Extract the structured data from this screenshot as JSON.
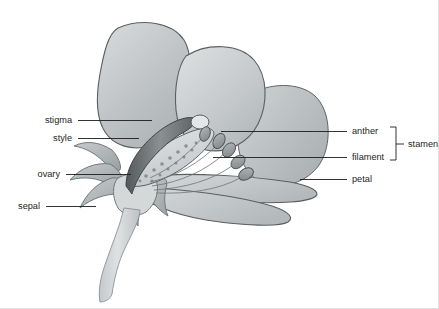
{
  "figure": {
    "background_color": "#ffffff",
    "line_color": "#1d1d1d",
    "petal_color": "#b9bdbf",
    "petal_highlight_color": "#d8dbdc",
    "sepal_color": "#a9aeb0",
    "stem_color": "#c9cdcf",
    "anther_color": "#9a9fa2",
    "ovary_color": "#cfd3d4",
    "style_color": "#70757a"
  },
  "labels": {
    "left": [
      {
        "id": "stigma",
        "text": "stigma",
        "text_x": 72,
        "text_y": 123,
        "line_x1": 78,
        "line_x2": 152,
        "line_y": 120
      },
      {
        "id": "style",
        "text": "style",
        "text_x": 72,
        "text_y": 141,
        "line_x1": 78,
        "line_x2": 139,
        "line_y": 138
      },
      {
        "id": "ovary",
        "text": "ovary",
        "text_x": 60,
        "text_y": 177,
        "line_x1": 66,
        "line_x2": 131,
        "line_y": 174
      },
      {
        "id": "sepal",
        "text": "sepal",
        "text_x": 40,
        "text_y": 209,
        "line_x1": 46,
        "line_x2": 96,
        "line_y": 206
      }
    ],
    "right": [
      {
        "id": "anther",
        "text": "anther",
        "text_x": 352,
        "text_y": 134,
        "line_x1": 221,
        "line_x2": 347,
        "line_y": 131
      },
      {
        "id": "filament",
        "text": "filament",
        "text_x": 352,
        "text_y": 160,
        "line_x1": 213,
        "line_x2": 347,
        "line_y": 157
      },
      {
        "id": "petal",
        "text": "petal",
        "text_x": 352,
        "text_y": 182,
        "line_x1": 300,
        "line_x2": 347,
        "line_y": 179
      }
    ],
    "group": {
      "id": "stamen",
      "text": "stamen",
      "text_x": 411,
      "text_y": 148,
      "bracket_x": 396,
      "bracket_top": 127,
      "bracket_bottom": 160,
      "tick_length": 6,
      "stem_x2": 406,
      "stem_y": 144,
      "members": [
        "anther",
        "filament"
      ]
    }
  },
  "parts": [
    {
      "id": "petal-upper-left",
      "name": "upper left petal"
    },
    {
      "id": "petal-upper-mid",
      "name": "upper middle petal"
    },
    {
      "id": "petal-right",
      "name": "right side petal"
    },
    {
      "id": "petal-lower",
      "name": "lower petal"
    },
    {
      "id": "petal-lower-front",
      "name": "lower front petal"
    },
    {
      "id": "sepals",
      "name": "sepals"
    },
    {
      "id": "stem",
      "name": "stem"
    },
    {
      "id": "ovary",
      "name": "ovary"
    },
    {
      "id": "style",
      "name": "style"
    },
    {
      "id": "stigma",
      "name": "stigma"
    },
    {
      "id": "stamens",
      "name": "stamens"
    }
  ]
}
